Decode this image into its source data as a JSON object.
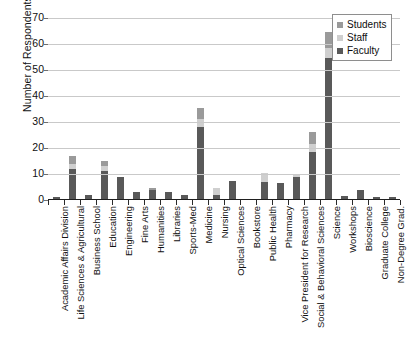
{
  "chart_data": {
    "type": "bar",
    "subtype": "stacked-bar",
    "title": "",
    "xlabel": "",
    "ylabel": "Number of Respondents",
    "ylim": [
      0,
      70
    ],
    "ytick_values": [
      0,
      10,
      20,
      30,
      40,
      50,
      60,
      70
    ],
    "ytick_labels": [
      "0",
      "10",
      "20",
      "30",
      "40",
      "50",
      "60",
      "70"
    ],
    "grid": true,
    "legend_position": "top-right",
    "categories": [
      "Academic Affairs Division",
      "Life Sciences & Agricultural",
      "Business School",
      "Education",
      "Engineering",
      "Fine Arts",
      "Humanities",
      "Libraries",
      "Sports-Med",
      "Medicine",
      "Nursing",
      "Optical Sciences",
      "Bookstore",
      "Public Health",
      "Pharmacy",
      "Vice President for Research",
      "Social & Behavioral Sciences",
      "Science",
      "Workshops",
      "Bioscience",
      "Graduate College",
      "Non-Degree Grad."
    ],
    "series": [
      {
        "name": "Faculty",
        "color": "#595959",
        "values": [
          1,
          12,
          2,
          11,
          9,
          3,
          4,
          3,
          2,
          28,
          2,
          7.5,
          0.5,
          7,
          6.5,
          9,
          18.5,
          54.5,
          1.5,
          4,
          1,
          1
        ]
      },
      {
        "name": "Staff",
        "color": "#cfcfcf",
        "values": [
          0,
          2,
          0,
          2,
          0,
          0,
          0,
          0,
          0,
          3,
          2.5,
          0,
          0,
          3.5,
          0,
          1,
          3,
          4,
          0,
          0,
          0,
          0
        ]
      },
      {
        "name": "Students",
        "color": "#9a9a9a",
        "values": [
          0,
          3,
          0,
          2,
          0,
          0,
          0.5,
          0,
          0,
          4.5,
          0,
          0,
          0,
          0,
          0,
          0,
          4.5,
          6,
          0,
          0,
          0,
          0
        ]
      }
    ],
    "totals": [
      1,
      17,
      2,
      15,
      9,
      3,
      4.5,
      3,
      2,
      35.5,
      4.5,
      7.5,
      0.5,
      10.5,
      6.5,
      10,
      26,
      64.5,
      1.5,
      4,
      1,
      1
    ]
  },
  "legend": {
    "items": [
      {
        "label": "Students",
        "color": "#9a9a9a"
      },
      {
        "label": "Staff",
        "color": "#cfcfcf"
      },
      {
        "label": "Faculty",
        "color": "#595959"
      }
    ]
  }
}
